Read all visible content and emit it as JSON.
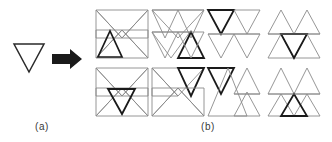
{
  "figure": {
    "type": "diagram",
    "background_color": "#ffffff",
    "line_color_thin": "#8a8a8a",
    "line_color_bold": "#1a1a1a",
    "arrow_color": "#1a1a1a",
    "label_color": "#3a3a3a"
  },
  "panels": [
    {
      "id": "a",
      "label": "(a)",
      "label_x": 42,
      "label_y": 127,
      "source_shape": "downward-triangle",
      "arrow": "rightwards-arrow"
    },
    {
      "id": "b",
      "label": "(b)",
      "label_x": 196,
      "label_y": 127,
      "variant_count": 8
    }
  ],
  "source_triangle": {
    "name": "downward-triangle",
    "orientation": "down",
    "x": 14,
    "y": 44,
    "width": 30,
    "height": 28,
    "stroke": "#2a2a2a",
    "stroke_width": 1.4
  },
  "arrow": {
    "name": "rightwards-arrow",
    "x": 52,
    "y": 52,
    "width": 28,
    "height": 14,
    "fill": "#1a1a1a"
  },
  "variants": [
    {
      "index": 1,
      "row": 1,
      "col": 1,
      "origin_x": 96,
      "origin_y": 8,
      "cell_w": 52,
      "cell_h": 52,
      "shape_group": "bowtie",
      "bold_triangle": "bottom-left-up",
      "triangles": [
        {
          "id": "t1",
          "orientation": "down",
          "cx": 0.25,
          "row": "top",
          "bold": false
        },
        {
          "id": "t2",
          "orientation": "down",
          "cx": 0.75,
          "row": "top",
          "bold": false
        },
        {
          "id": "t3",
          "orientation": "up",
          "cx": 0.25,
          "row": "bottom",
          "bold": true
        },
        {
          "id": "t4",
          "orientation": "up",
          "cx": 0.75,
          "row": "bottom",
          "bold": false
        }
      ]
    },
    {
      "index": 2,
      "row": 1,
      "col": 2,
      "origin_x": 152,
      "origin_y": 8,
      "cell_w": 52,
      "cell_h": 52,
      "shape_group": "offset",
      "bold_triangle": "bottom-right-up",
      "triangles": [
        {
          "id": "t1",
          "orientation": "down",
          "cx": 0.25,
          "row": "top",
          "bold": false
        },
        {
          "id": "t2",
          "orientation": "down",
          "cx": 0.75,
          "row": "top",
          "bold": false
        },
        {
          "id": "t3",
          "orientation": "down",
          "cx": 0.25,
          "row": "bottom",
          "bold": false
        },
        {
          "id": "t4",
          "orientation": "up",
          "cx": 0.75,
          "row": "bottom",
          "bold": true
        }
      ]
    },
    {
      "index": 3,
      "row": 1,
      "col": 3,
      "origin_x": 208,
      "origin_y": 8,
      "cell_w": 52,
      "cell_h": 52,
      "shape_group": "stacked-down",
      "bold_triangle": "top-left-down",
      "triangles": [
        {
          "id": "t1",
          "orientation": "down",
          "cx": 0.25,
          "row": "top",
          "bold": true
        },
        {
          "id": "t2",
          "orientation": "down",
          "cx": 0.75,
          "row": "top",
          "bold": false
        },
        {
          "id": "t3",
          "orientation": "down",
          "cx": 0.25,
          "row": "bottom",
          "bold": false
        },
        {
          "id": "t4",
          "orientation": "down",
          "cx": 0.75,
          "row": "bottom",
          "bold": false
        }
      ]
    },
    {
      "index": 4,
      "row": 1,
      "col": 4,
      "origin_x": 268,
      "origin_y": 8,
      "cell_w": 52,
      "cell_h": 52,
      "shape_group": "up-pair",
      "bold_triangle": "center-down",
      "triangles": [
        {
          "id": "t1",
          "orientation": "up",
          "cx": 0.25,
          "row": "top",
          "bold": false
        },
        {
          "id": "t2",
          "orientation": "up",
          "cx": 0.75,
          "row": "top",
          "bold": false
        },
        {
          "id": "t3",
          "orientation": "down",
          "cx": 0.5,
          "row": "bottom",
          "bold": true
        },
        {
          "id": "t4",
          "orientation": "up",
          "cx": 0.25,
          "row": "bottom",
          "bold": false
        }
      ]
    },
    {
      "index": 5,
      "row": 2,
      "col": 1,
      "origin_x": 96,
      "origin_y": 66,
      "cell_w": 52,
      "cell_h": 52,
      "shape_group": "bowtie",
      "bold_triangle": "center-down",
      "triangles": [
        {
          "id": "t1",
          "orientation": "down",
          "cx": 0.25,
          "row": "top",
          "bold": false
        },
        {
          "id": "t2",
          "orientation": "down",
          "cx": 0.75,
          "row": "top",
          "bold": false
        },
        {
          "id": "t3",
          "orientation": "down",
          "cx": 0.5,
          "row": "bottom",
          "bold": true
        },
        {
          "id": "t4",
          "orientation": "up",
          "cx": 0.75,
          "row": "bottom",
          "bold": false
        }
      ]
    },
    {
      "index": 6,
      "row": 2,
      "col": 2,
      "origin_x": 152,
      "origin_y": 66,
      "cell_w": 52,
      "cell_h": 52,
      "shape_group": "zigzag",
      "bold_triangle": "top-right-down",
      "triangles": [
        {
          "id": "t1",
          "orientation": "down",
          "cx": 0.25,
          "row": "top",
          "bold": false
        },
        {
          "id": "t2",
          "orientation": "down",
          "cx": 0.75,
          "row": "top",
          "bold": true
        },
        {
          "id": "t3",
          "orientation": "up",
          "cx": 0.5,
          "row": "bottom",
          "bold": false
        },
        {
          "id": "t4",
          "orientation": "up",
          "cx": 0.9,
          "row": "bottom",
          "bold": false
        }
      ]
    },
    {
      "index": 7,
      "row": 2,
      "col": 3,
      "origin_x": 208,
      "origin_y": 66,
      "cell_w": 52,
      "cell_h": 52,
      "shape_group": "split",
      "bold_triangle": "top-left-down",
      "triangles": [
        {
          "id": "t1",
          "orientation": "down",
          "cx": 0.25,
          "row": "top",
          "bold": true
        },
        {
          "id": "t2",
          "orientation": "up",
          "cx": 0.72,
          "row": "top",
          "bold": false
        },
        {
          "id": "t3",
          "orientation": "up",
          "cx": 0.45,
          "row": "bottom",
          "bold": false
        },
        {
          "id": "t4",
          "orientation": "up",
          "cx": 0.78,
          "row": "bottom",
          "bold": false
        }
      ]
    },
    {
      "index": 8,
      "row": 2,
      "col": 4,
      "origin_x": 268,
      "origin_y": 66,
      "cell_w": 52,
      "cell_h": 52,
      "shape_group": "up-pair",
      "bold_triangle": "bottom-center-up",
      "triangles": [
        {
          "id": "t1",
          "orientation": "up",
          "cx": 0.25,
          "row": "top",
          "bold": false
        },
        {
          "id": "t2",
          "orientation": "up",
          "cx": 0.75,
          "row": "top",
          "bold": false
        },
        {
          "id": "t3",
          "orientation": "up",
          "cx": 0.5,
          "row": "bottom",
          "bold": true
        },
        {
          "id": "t4",
          "orientation": "up",
          "cx": 0.25,
          "row": "bottom",
          "bold": false
        }
      ]
    }
  ]
}
